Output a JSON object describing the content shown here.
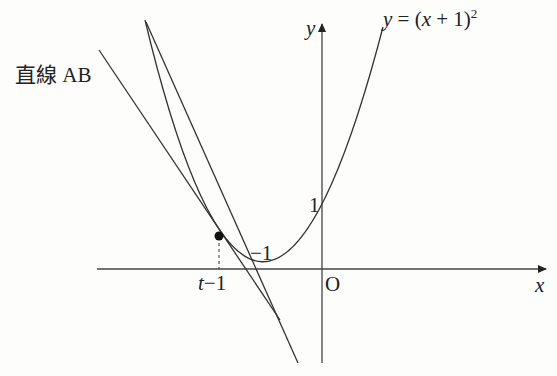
{
  "diagram": {
    "curve_label": "y = (x + 1)²",
    "curve_label_parts": {
      "y": "y",
      "eq": " = (",
      "x": "x",
      "rest": " + 1)",
      "sup": "2"
    },
    "line_label": "直線 AB",
    "axis_x_label": "x",
    "axis_y_label": "y",
    "origin_label": "O",
    "y_intercept_label": "1",
    "vertex_label": "−1",
    "tangent_x_label_t": "t",
    "tangent_x_label_rest": "−1",
    "colors": {
      "stroke": "#333333",
      "background": "#fdfdfb"
    }
  }
}
